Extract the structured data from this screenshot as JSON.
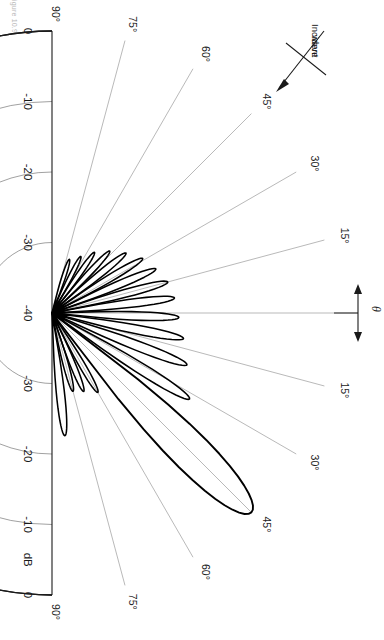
{
  "figure": {
    "caption": "Figure 10.9",
    "title": "",
    "annotations": [
      {
        "name": "incident-wave",
        "line1": "Incident",
        "line2": "wave",
        "angle_deg": 45
      },
      {
        "name": "theta-symbol",
        "text": "θ"
      }
    ]
  },
  "chart_data": {
    "type": "line",
    "plot_style": "polar-half-plane",
    "title": "",
    "subtitle": "",
    "xlabel": "",
    "ylabel": "dB",
    "radial_axis": {
      "label": "dB",
      "unit": "dB",
      "min": -40,
      "max": 0,
      "tick_step": 10,
      "ticks_upper": [
        "0",
        "-10",
        "-20",
        "-30",
        "-40"
      ],
      "ticks_lower": [
        "-30",
        "-20",
        "-10",
        "dB",
        "0"
      ],
      "origin_value": -40,
      "rim_value": 0
    },
    "angular_axis": {
      "label": "θ",
      "unit": "degrees",
      "min": -90,
      "max": 90,
      "tick_step": 15,
      "ticks_upper": [
        "90°",
        "75°",
        "60°",
        "45°",
        "30°",
        "15°"
      ],
      "ticks_lower": [
        "15°",
        "30°",
        "45°",
        "60°",
        "75°",
        "90°"
      ],
      "zero_direction": "right",
      "grid_every_deg": 15
    },
    "grid": true,
    "legend": false,
    "legend_position": "none",
    "series": [
      {
        "name": "array pattern",
        "description": "scanned phased-array radiation pattern, main beam near -45 deg",
        "main_beam_angle_deg": -45,
        "main_beam_level_db": 0,
        "lobes": [
          {
            "angle_deg": 72,
            "peak_db": -32.0
          },
          {
            "angle_deg": 63,
            "peak_db": -31.0
          },
          {
            "angle_deg": 55,
            "peak_db": -29.5
          },
          {
            "angle_deg": 47,
            "peak_db": -28.0
          },
          {
            "angle_deg": 39,
            "peak_db": -26.5
          },
          {
            "angle_deg": 31,
            "peak_db": -25.0
          },
          {
            "angle_deg": 23,
            "peak_db": -24.0
          },
          {
            "angle_deg": 15,
            "peak_db": -23.0
          },
          {
            "angle_deg": 7,
            "peak_db": -22.5
          },
          {
            "angle_deg": -2,
            "peak_db": -22.0
          },
          {
            "angle_deg": -11,
            "peak_db": -21.0
          },
          {
            "angle_deg": -21,
            "peak_db": -19.5
          },
          {
            "angle_deg": -32,
            "peak_db": -17.0
          },
          {
            "angle_deg": -45,
            "peak_db": 0.0
          },
          {
            "angle_deg": -60,
            "peak_db": -27.0
          },
          {
            "angle_deg": -68,
            "peak_db": -28.0
          },
          {
            "angle_deg": -75,
            "peak_db": -28.5
          },
          {
            "angle_deg": -84,
            "peak_db": -22.5
          }
        ]
      }
    ]
  }
}
